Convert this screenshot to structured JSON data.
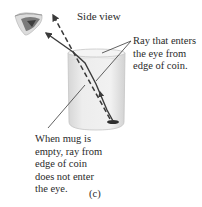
{
  "figure": {
    "title": "Side view",
    "caption": "(c)",
    "labels": {
      "entering_ray": [
        "Ray that enters",
        "the eye from",
        "edge of coin."
      ],
      "empty_mug": [
        "When mug is",
        "empty, ray from",
        "edge of coin",
        "does not enter",
        "the eye."
      ]
    },
    "elements": {
      "eye": "eye-icon",
      "mug": "mug",
      "coin": "coin",
      "solid_ray": "refracted ray (solid)",
      "dashed_ray": "apparent ray (dashed)"
    },
    "colors": {
      "ray": "#3a3a3a",
      "mug_fill": "#e4e4e4",
      "mug_edge": "#bdbdbd",
      "eye": "#6a6a6a",
      "text": "#2a2a2a"
    }
  }
}
